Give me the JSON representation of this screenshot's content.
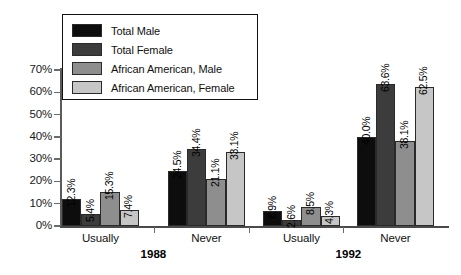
{
  "chart_data": {
    "type": "bar",
    "title": "",
    "subtitle": "",
    "xlabel": "",
    "ylabel": "",
    "ylim": [
      0,
      70
    ],
    "grid": false,
    "legend_position": "top-left-inside",
    "y_tick_labels": [
      "70%",
      "60%",
      "50%",
      "40%",
      "30%",
      "20%",
      "10%",
      "0%"
    ],
    "y_tick_values": [
      70,
      60,
      50,
      40,
      30,
      20,
      10,
      0
    ],
    "categories": [
      "Usually",
      "Never",
      "Usually",
      "Never"
    ],
    "super_categories": [
      "1988",
      "1992"
    ],
    "series": [
      {
        "name": "Total Male",
        "color": "#0d0d0d",
        "values": [
          12.3,
          24.5,
          6.9,
          40.0
        ],
        "labels": [
          "12.3%",
          "24.5%",
          "6.9%",
          "40.0%"
        ]
      },
      {
        "name": "Total Female",
        "color": "#3c3c3c",
        "values": [
          5.4,
          34.4,
          2.6,
          63.6
        ],
        "labels": [
          "5.4%",
          "34.4%",
          "2.6%",
          "63.6%"
        ]
      },
      {
        "name": "African American, Male",
        "color": "#8e8e8e",
        "values": [
          15.3,
          21.1,
          8.5,
          38.1
        ],
        "labels": [
          "15.3%",
          "21.1%",
          "8.5%",
          "38.1%"
        ]
      },
      {
        "name": "African American, Female",
        "color": "#c6c6c6",
        "values": [
          7.4,
          33.1,
          4.3,
          62.5
        ],
        "labels": [
          "7.4%",
          "33.1%",
          "4.3%",
          "62.5%"
        ]
      }
    ]
  },
  "legend": {
    "entries": [
      {
        "label": "Total Male",
        "color": "#0d0d0d"
      },
      {
        "label": "Total Female",
        "color": "#3c3c3c"
      },
      {
        "label": "African American, Male",
        "color": "#8e8e8e"
      },
      {
        "label": "African American, Female",
        "color": "#c6c6c6"
      }
    ]
  }
}
